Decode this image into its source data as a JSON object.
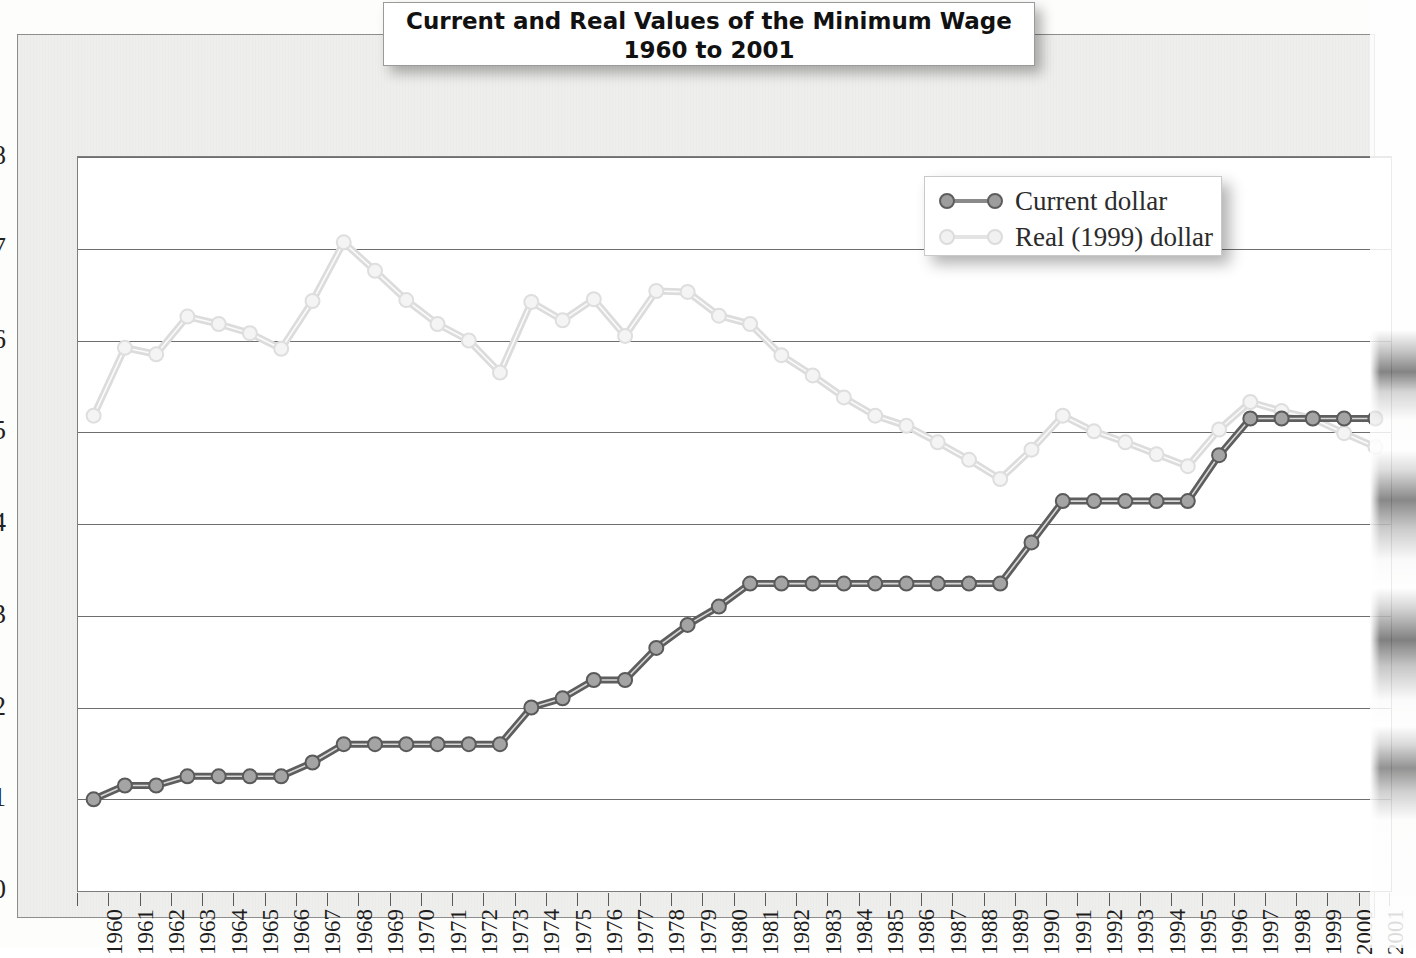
{
  "title": {
    "line1": "Current and Real Values of the Minimum Wage",
    "line2": "1960 to 2001"
  },
  "legend": {
    "position": "top-right",
    "items": [
      {
        "label": "Current dollar",
        "color": "#8a8a8a"
      },
      {
        "label": "Real (1999) dollar",
        "color": "#e2e2e2"
      }
    ]
  },
  "axis": {
    "y_ticks": [
      "0",
      "1",
      "2",
      "3",
      "4",
      "5",
      "6",
      "7",
      "8"
    ],
    "y_min": 0,
    "y_max": 8
  },
  "chart_data": {
    "type": "line",
    "title": "Current and Real Values of the Minimum Wage 1960 to 2001",
    "xlabel": "",
    "ylabel": "",
    "ylim": [
      0,
      8
    ],
    "ytick_step": 1,
    "grid": true,
    "legend_position": "top-right",
    "categories": [
      "1960",
      "1961",
      "1962",
      "1963",
      "1964",
      "1965",
      "1966",
      "1967",
      "1968",
      "1969",
      "1970",
      "1971",
      "1972",
      "1973",
      "1974",
      "1975",
      "1976",
      "1977",
      "1978",
      "1979",
      "1980",
      "1981",
      "1982",
      "1983",
      "1984",
      "1985",
      "1986",
      "1987",
      "1988",
      "1989",
      "1990",
      "1991",
      "1992",
      "1993",
      "1994",
      "1995",
      "1996",
      "1997",
      "1998",
      "1999",
      "2000",
      "2001"
    ],
    "series": [
      {
        "name": "Current dollar",
        "color": "#8a8a8a",
        "values": [
          1.0,
          1.15,
          1.15,
          1.25,
          1.25,
          1.25,
          1.25,
          1.4,
          1.6,
          1.6,
          1.6,
          1.6,
          1.6,
          1.6,
          2.0,
          2.1,
          2.3,
          2.3,
          2.65,
          2.9,
          3.1,
          3.35,
          3.35,
          3.35,
          3.35,
          3.35,
          3.35,
          3.35,
          3.35,
          3.35,
          3.8,
          4.25,
          4.25,
          4.25,
          4.25,
          4.25,
          4.75,
          5.15,
          5.15,
          5.15,
          5.15,
          5.15
        ]
      },
      {
        "name": "Real (1999) dollar",
        "color": "#e2e2e2",
        "values": [
          5.18,
          5.92,
          5.85,
          6.26,
          6.18,
          6.08,
          5.91,
          6.43,
          7.07,
          6.76,
          6.44,
          6.18,
          6.0,
          5.65,
          6.42,
          6.22,
          6.45,
          6.05,
          6.54,
          6.53,
          6.27,
          6.18,
          5.84,
          5.62,
          5.38,
          5.18,
          5.07,
          4.89,
          4.7,
          4.49,
          4.81,
          5.18,
          5.01,
          4.89,
          4.76,
          4.63,
          5.03,
          5.33,
          5.23,
          5.15,
          4.99,
          4.84
        ]
      }
    ]
  }
}
